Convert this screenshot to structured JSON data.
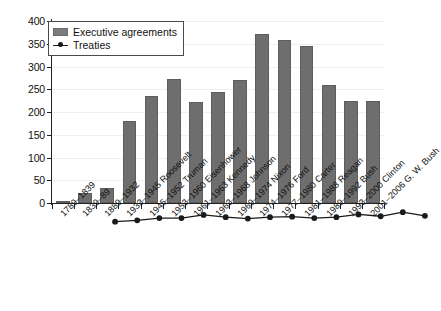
{
  "chart_data": {
    "type": "bar",
    "title": "",
    "subtitle": "",
    "xlabel": "",
    "ylabel": "",
    "ylim": [
      0,
      400
    ],
    "yticks": [
      0,
      50,
      100,
      150,
      200,
      250,
      300,
      350,
      400
    ],
    "grid": true,
    "legend_position": "top-left",
    "categories": [
      "1789–1839",
      "1839–89",
      "1889–1932",
      "1933–1945 Roosevelt",
      "1945–1952 Truman",
      "1953–1960 Eisenhower",
      "1961–1963 Kennedy",
      "1963–1968 Johnson",
      "1969–1974 Nixon",
      "1974–1976 Ford",
      "1977–1980 Carter",
      "1981–1988 Reagan",
      "1989–1992 Bush",
      "1993–2000 Clinton",
      "2001–2006 G. W. Bush"
    ],
    "series": [
      {
        "name": "Executive agreements",
        "color": "#6e6e6e",
        "values": [
          3,
          22,
          32,
          180,
          235,
          272,
          222,
          245,
          270,
          372,
          358,
          344,
          259,
          224,
          224
        ]
      },
      {
        "name": "Treaties",
        "color": "#1a1a1a",
        "values": [
          5,
          8,
          13,
          13,
          20,
          15,
          12,
          15,
          16,
          13,
          15,
          21,
          17,
          26,
          18
        ]
      }
    ]
  },
  "legend": {
    "items": [
      {
        "label": "Executive agreements",
        "marker": "bar-swatch"
      },
      {
        "label": "Treaties",
        "marker": "line-marker"
      }
    ]
  },
  "axes": {
    "y": {
      "ticks": [
        "0",
        "50",
        "100",
        "150",
        "200",
        "250",
        "300",
        "350",
        "400"
      ]
    }
  },
  "colors": {
    "bar_fill": "#6e6e6e",
    "bar_stroke": "#5d5d5d",
    "line": "#1a1a1a",
    "marker": "#1a1a1a",
    "axis": "#222222",
    "grid": "#f0f0f0",
    "background": "#ffffff"
  }
}
